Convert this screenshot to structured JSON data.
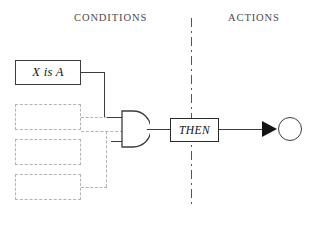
{
  "diagram": {
    "title_columns": {
      "conditions": "CONDITIONS",
      "actions": "ACTIONS"
    },
    "nodes": {
      "condition_box": {
        "label": "X is A",
        "style": "solid",
        "italic": true
      },
      "placeholder_boxes": [
        {
          "label": "",
          "style": "dashed"
        },
        {
          "label": "",
          "style": "dashed"
        },
        {
          "label": "",
          "style": "dashed"
        }
      ],
      "logic_gate": {
        "type": "and-gate",
        "label": ""
      },
      "then_box": {
        "label": "THEN",
        "style": "solid-bold",
        "italic": true
      },
      "output_node": {
        "label": "",
        "shape": "circle"
      }
    },
    "connectors": {
      "condition_to_gate": "solid",
      "placeholders_to_gate": "dashed",
      "gate_to_then": "solid",
      "then_to_output": "solid-arrow"
    },
    "divider": {
      "orientation": "vertical",
      "style": "dash-dot"
    },
    "colors": {
      "background": "#ffffff",
      "stroke": "#3c3c3c",
      "dashed_stroke": "#b3b3b3",
      "divider": "#55565a",
      "header_text": "#4a4a4a",
      "arrow_fill": "#151515"
    }
  }
}
